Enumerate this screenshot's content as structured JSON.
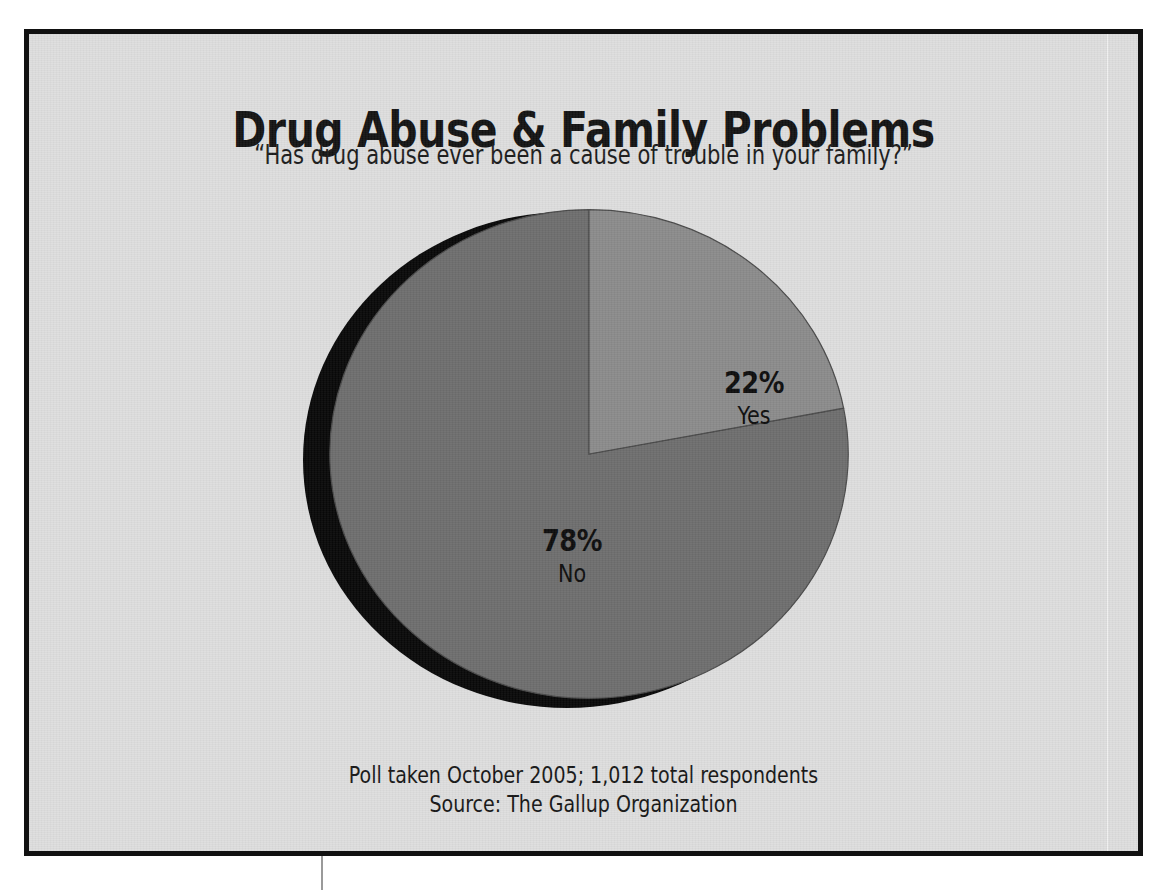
{
  "figure": {
    "title": "Drug Abuse & Family Problems",
    "subtitle": "“Has drug abuse ever been a cause of trouble in your family?”",
    "footnote_line1": "Poll taken October 2005; 1,012 total respondents",
    "footnote_line2": "Source: The Gallup Organization",
    "frame_color": "#111111",
    "background_color": "#dedede"
  },
  "chart_data": {
    "type": "pie",
    "title": "Drug Abuse & Family Problems",
    "subtitle": "“Has drug abuse ever been a cause of trouble in your family?”",
    "xlabel": "",
    "ylabel": "",
    "units": "percent",
    "legend": "none",
    "grid": false,
    "start_angle_deg": 0,
    "direction": "clockwise",
    "categories": [
      "Yes",
      "No"
    ],
    "values": [
      22,
      78
    ],
    "colors": [
      "#8b8b8b",
      "#6e6e6e"
    ],
    "slices": [
      {
        "label": "Yes",
        "value": 22,
        "display": "22%",
        "color": "#8b8b8b",
        "sweep_deg": 79.2
      },
      {
        "label": "No",
        "value": 78,
        "display": "78%",
        "color": "#6e6e6e",
        "sweep_deg": 280.8
      }
    ],
    "annotations": [
      "Poll taken October 2005; 1,012 total respondents",
      "Source: The Gallup Organization"
    ],
    "total_respondents": 1012,
    "poll_date": "October 2005",
    "source": "The Gallup Organization"
  },
  "labels": {
    "yes_pct": "22%",
    "yes_name": "Yes",
    "no_pct": "78%",
    "no_name": "No"
  }
}
